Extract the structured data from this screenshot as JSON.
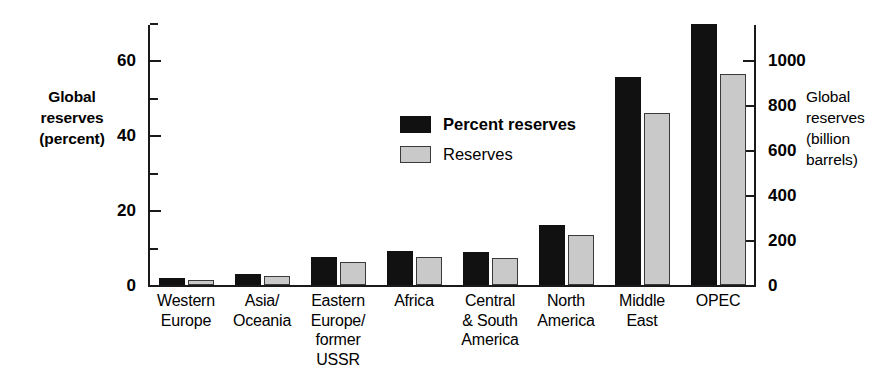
{
  "chart_data": {
    "type": "bar",
    "title": "",
    "categories": [
      "Western Europe",
      "Asia/ Oceania",
      "Eastern Europe/ former USSR",
      "Africa",
      "Central & South America",
      "North America",
      "Middle East",
      "OPEC"
    ],
    "category_lines": [
      [
        "Western",
        "Europe"
      ],
      [
        "Asia/",
        "Oceania"
      ],
      [
        "Eastern",
        "Europe/",
        "former",
        "USSR"
      ],
      [
        "Africa"
      ],
      [
        "Central",
        "& South",
        "America"
      ],
      [
        "North",
        "America"
      ],
      [
        "Middle",
        "East"
      ],
      [
        "OPEC"
      ]
    ],
    "series": [
      {
        "name": "Percent reserves",
        "axis": "left",
        "unit": "percent",
        "color": "#111111",
        "values": [
          2.0,
          3.0,
          7.5,
          9.0,
          8.7,
          16.0,
          55.5,
          69.5
        ]
      },
      {
        "name": "Reserves",
        "axis": "right",
        "unit": "billion barrels",
        "color": "#c9c9c9",
        "values": [
          22,
          38,
          104,
          124,
          119,
          221,
          765,
          940
        ]
      }
    ],
    "left_axis": {
      "label": "Global reserves (percent)",
      "label_lines": [
        "Global",
        "reserves",
        "(percent)"
      ],
      "ticks": [
        0,
        20,
        40,
        60
      ],
      "minor_ticks": [
        10,
        30,
        50,
        70
      ],
      "ylim": [
        0,
        70
      ]
    },
    "right_axis": {
      "label": "Global reserves (billion barrels)",
      "label_lines": [
        "Global",
        "reserves",
        "(billion",
        "barrels)"
      ],
      "ticks": [
        0,
        200,
        400,
        600,
        800,
        1000
      ],
      "ylim": [
        0,
        1166
      ]
    },
    "legend": {
      "position": "upper-left-inside",
      "entries": [
        {
          "label": "Percent reserves",
          "swatch": "black",
          "bold": true
        },
        {
          "label": "Reserves",
          "swatch": "gray",
          "bold": false
        }
      ]
    },
    "grid": false
  }
}
